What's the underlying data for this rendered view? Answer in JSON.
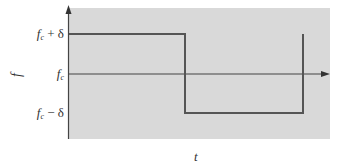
{
  "diagram": {
    "type": "frequency-shift-keying-waveform",
    "background_color": "#d9d9d9",
    "line_color": "#555555",
    "axis_color": "#444444",
    "plot_area": {
      "x": 69,
      "y": 8,
      "width": 261,
      "height": 131
    }
  },
  "axes": {
    "x_label": "t",
    "y_label": "f",
    "y_ticks": [
      {
        "base": "f",
        "sub": "c",
        "suffix": " + δ",
        "y": 34
      },
      {
        "base": "f",
        "sub": "c",
        "suffix": "",
        "y": 74
      },
      {
        "base": "f",
        "sub": "c",
        "suffix": " − δ",
        "y": 113
      }
    ]
  },
  "waveform": {
    "segments": [
      {
        "level": "fc + δ",
        "x_start": 69,
        "x_end": 185
      },
      {
        "level": "fc − δ",
        "x_start": 185,
        "x_end": 303
      }
    ],
    "final_rise_x": 303
  }
}
